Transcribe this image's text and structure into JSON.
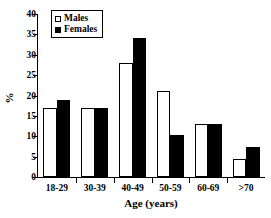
{
  "chart_data": {
    "type": "bar",
    "title": "",
    "subtitle": "",
    "xlabel": "Age (years)",
    "ylabel": "%",
    "categories": [
      "18-29",
      "30-39",
      "40-49",
      "50-59",
      "60-69",
      ">70"
    ],
    "series": [
      {
        "name": "Males",
        "values": [
          17,
          17,
          28,
          21,
          13,
          4.3
        ],
        "color": "#ffffff"
      },
      {
        "name": "Females",
        "values": [
          19,
          17,
          34,
          10.2,
          13,
          7.3
        ],
        "color": "#000000"
      }
    ],
    "ylim": [
      0,
      40
    ],
    "yticks": [
      0,
      5,
      10,
      15,
      20,
      25,
      30,
      35,
      40
    ],
    "ytick_labels": [
      "0",
      "5",
      "10",
      "15",
      "20",
      "25",
      "30",
      "35",
      "40"
    ],
    "grid": false,
    "legend_position": "top-left",
    "legend_entries": [
      "Males",
      "Females"
    ]
  },
  "legend": {
    "items": [
      {
        "label": "Males",
        "swatch": "open-square-icon"
      },
      {
        "label": "Females",
        "swatch": "filled-square-icon"
      }
    ]
  },
  "axes": {
    "y_label": "%",
    "x_label": "Age (years)"
  }
}
